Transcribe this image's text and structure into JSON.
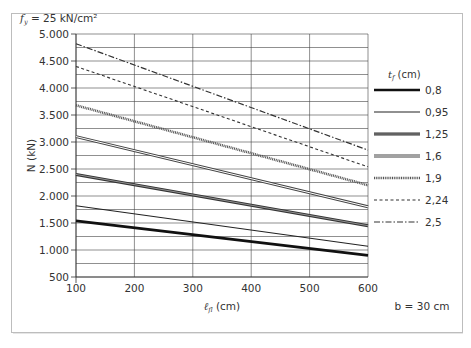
{
  "chart_data": {
    "type": "line",
    "title_parts": {
      "symbol": "f",
      "subscript": "y",
      "rest": " = 25 kN/cm²"
    },
    "xlabel": "ℓ_fl (cm)",
    "xlabel_parts": {
      "symbol": "ℓ",
      "subscript": "fl",
      "rest": " (cm)"
    },
    "ylabel": "N (kN)",
    "annotation": "b = 30 cm",
    "xlim": [
      100,
      600
    ],
    "ylim": [
      500,
      5000
    ],
    "x_ticks": [
      "100",
      "200",
      "300",
      "400",
      "500",
      "600"
    ],
    "y_ticks": [
      "500",
      "1.000",
      "1.500",
      "2.000",
      "2.500",
      "3.000",
      "3.500",
      "4.000",
      "4.500",
      "5.000"
    ],
    "grid": true,
    "legend_title": "t_f (cm)",
    "legend_title_parts": {
      "symbol": "t",
      "subscript": "f",
      "rest": " (cm)"
    },
    "legend_position": "right",
    "x": [
      100,
      600
    ],
    "series": [
      {
        "name": "0,8",
        "values": [
          1540,
          900
        ],
        "style": "thick-solid"
      },
      {
        "name": "0,95",
        "values": [
          1820,
          1070
        ],
        "style": "thin-solid"
      },
      {
        "name": "1,25",
        "values": [
          2400,
          1450
        ],
        "style": "double-dark"
      },
      {
        "name": "1,6",
        "values": [
          3100,
          1800
        ],
        "style": "double-light"
      },
      {
        "name": "1,9",
        "values": [
          3680,
          2200
        ],
        "style": "dense-dotted"
      },
      {
        "name": "2,24",
        "values": [
          4400,
          2540
        ],
        "style": "dashed"
      },
      {
        "name": "2,5",
        "values": [
          4820,
          2850
        ],
        "style": "dash-dot"
      }
    ]
  }
}
